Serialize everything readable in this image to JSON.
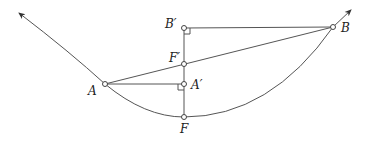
{
  "diagram": {
    "points": {
      "A": {
        "label": "A",
        "x": 105,
        "y": 84
      },
      "B": {
        "label": "B",
        "x": 333,
        "y": 27
      },
      "A_prime": {
        "label": "A′",
        "x": 184,
        "y": 84
      },
      "B_prime": {
        "label": "B′",
        "x": 184,
        "y": 28
      },
      "F": {
        "label": "F",
        "x": 184,
        "y": 117
      },
      "F_prime": {
        "label": "F′",
        "x": 184,
        "y": 64
      }
    },
    "curve": "parabola",
    "arrow_ends": {
      "left": {
        "x": 17,
        "y": 11
      },
      "right": {
        "x": 353,
        "y": 8
      }
    },
    "colors": {
      "stroke": "#555555",
      "point_fill": "#ffffff",
      "text": "#222222"
    }
  }
}
